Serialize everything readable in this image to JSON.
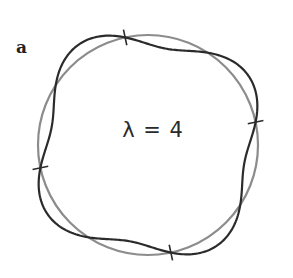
{
  "panel_label": "a",
  "center_label": "λ = 4",
  "diagram": {
    "type": "perturbed-circle",
    "base_circle": {
      "cx": 148,
      "cy": 145,
      "r": 110,
      "color": "#8c8c8c"
    },
    "perturbed_curve": {
      "mode_number": 4,
      "amplitude": 12,
      "phase_deg": -102,
      "color": "#2b2b2b"
    },
    "tick_angles_deg": [
      -102,
      -12,
      78,
      168
    ]
  }
}
